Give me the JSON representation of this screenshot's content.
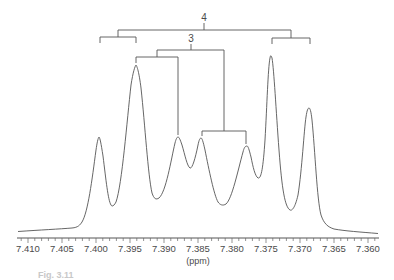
{
  "chart_data": {
    "type": "line",
    "title": "",
    "xlabel": "(ppm)",
    "ylabel": "",
    "x_reversed": true,
    "xlim": [
      7.4115,
      7.3575
    ],
    "x_ticks": [
      "7.410",
      "7.405",
      "7.400",
      "7.395",
      "7.390",
      "7.385",
      "7.380",
      "7.375",
      "7.370",
      "7.365",
      "7.360"
    ],
    "minor_tick_step": 0.001,
    "grid": false,
    "legend": null,
    "series": [
      {
        "name": "1H NMR spectrum",
        "peaks_ppm": [
          7.3996,
          7.3941,
          7.388,
          7.3846,
          7.3779,
          7.3744,
          7.3688
        ],
        "relative_heights": [
          0.55,
          1.0,
          0.56,
          0.55,
          0.51,
          1.05,
          0.74
        ]
      }
    ],
    "annotations": [
      {
        "label": "4",
        "type": "splitting-tree",
        "description": "outer coupling tree connecting outer doublets (peaks 1-2 and 6-7)",
        "branches_ppm": [
          [
            7.3996,
            7.3941
          ],
          [
            7.3744,
            7.3688
          ]
        ]
      },
      {
        "label": "3",
        "type": "splitting-tree",
        "description": "inner coupling tree connecting peaks 2-3 and 4-5",
        "branches_ppm": [
          [
            7.3941,
            7.388
          ],
          [
            7.3846,
            7.3779
          ]
        ]
      }
    ]
  },
  "axis": {
    "unit_label": "(ppm)",
    "tick_labels": [
      "7.410",
      "7.405",
      "7.400",
      "7.395",
      "7.390",
      "7.385",
      "7.380",
      "7.375",
      "7.370",
      "7.365",
      "7.360"
    ]
  },
  "annotations": {
    "outer_label": "4",
    "inner_label": "3"
  },
  "caption": "Fig. 3.11"
}
